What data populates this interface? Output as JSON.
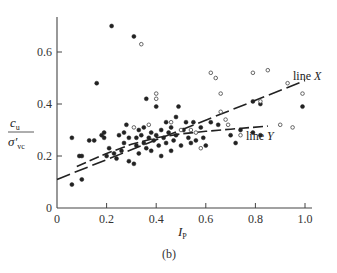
{
  "chart_data": {
    "type": "scatter",
    "title": "",
    "caption": "(b)",
    "xlabel": "I_P",
    "ylabel": "c_u / σ'_vc",
    "xlim": [
      0,
      1.0
    ],
    "ylim": [
      0,
      0.72
    ],
    "xticks": [
      "0",
      "0.2",
      "0.4",
      "0.6",
      "0.8",
      "1.0"
    ],
    "yticks": [
      "0",
      "0.2",
      "0.4",
      "0.6"
    ],
    "grid": false,
    "series": [
      {
        "name": "filled points",
        "marker": "filled-circle",
        "points": [
          [
            0.06,
            0.09
          ],
          [
            0.06,
            0.27
          ],
          [
            0.1,
            0.11
          ],
          [
            0.09,
            0.2
          ],
          [
            0.1,
            0.2
          ],
          [
            0.13,
            0.26
          ],
          [
            0.15,
            0.26
          ],
          [
            0.16,
            0.48
          ],
          [
            0.18,
            0.28
          ],
          [
            0.19,
            0.29
          ],
          [
            0.19,
            0.27
          ],
          [
            0.2,
            0.2
          ],
          [
            0.21,
            0.23
          ],
          [
            0.22,
            0.7
          ],
          [
            0.23,
            0.21
          ],
          [
            0.24,
            0.19
          ],
          [
            0.25,
            0.28
          ],
          [
            0.26,
            0.22
          ],
          [
            0.27,
            0.25
          ],
          [
            0.27,
            0.29
          ],
          [
            0.28,
            0.32
          ],
          [
            0.29,
            0.27
          ],
          [
            0.29,
            0.18
          ],
          [
            0.31,
            0.17
          ],
          [
            0.31,
            0.66
          ],
          [
            0.32,
            0.24
          ],
          [
            0.32,
            0.27
          ],
          [
            0.33,
            0.3
          ],
          [
            0.33,
            0.21
          ],
          [
            0.34,
            0.28
          ],
          [
            0.35,
            0.25
          ],
          [
            0.35,
            0.31
          ],
          [
            0.36,
            0.42
          ],
          [
            0.36,
            0.23
          ],
          [
            0.37,
            0.27
          ],
          [
            0.38,
            0.29
          ],
          [
            0.38,
            0.22
          ],
          [
            0.39,
            0.26
          ],
          [
            0.4,
            0.39
          ],
          [
            0.4,
            0.28
          ],
          [
            0.41,
            0.24
          ],
          [
            0.42,
            0.3
          ],
          [
            0.42,
            0.2
          ],
          [
            0.43,
            0.27
          ],
          [
            0.44,
            0.33
          ],
          [
            0.44,
            0.25
          ],
          [
            0.45,
            0.29
          ],
          [
            0.46,
            0.31
          ],
          [
            0.46,
            0.22
          ],
          [
            0.47,
            0.26
          ],
          [
            0.48,
            0.35
          ],
          [
            0.48,
            0.28
          ],
          [
            0.49,
            0.39
          ],
          [
            0.5,
            0.24
          ],
          [
            0.51,
            0.3
          ],
          [
            0.52,
            0.33
          ],
          [
            0.53,
            0.27
          ],
          [
            0.54,
            0.25
          ],
          [
            0.55,
            0.33
          ],
          [
            0.56,
            0.26
          ],
          [
            0.58,
            0.31
          ],
          [
            0.59,
            0.27
          ],
          [
            0.6,
            0.24
          ],
          [
            0.62,
            0.33
          ],
          [
            0.65,
            0.32
          ],
          [
            0.7,
            0.28
          ],
          [
            0.72,
            0.25
          ],
          [
            0.74,
            0.3
          ],
          [
            0.79,
            0.41
          ],
          [
            0.79,
            0.29
          ],
          [
            0.82,
            0.4
          ],
          [
            0.82,
            0.28
          ],
          [
            0.99,
            0.39
          ]
        ]
      },
      {
        "name": "open points",
        "marker": "open-circle",
        "points": [
          [
            0.34,
            0.63
          ],
          [
            0.4,
            0.44
          ],
          [
            0.4,
            0.42
          ],
          [
            0.37,
            0.32
          ],
          [
            0.31,
            0.31
          ],
          [
            0.46,
            0.33
          ],
          [
            0.5,
            0.3
          ],
          [
            0.54,
            0.3
          ],
          [
            0.56,
            0.29
          ],
          [
            0.58,
            0.23
          ],
          [
            0.62,
            0.52
          ],
          [
            0.64,
            0.5
          ],
          [
            0.66,
            0.44
          ],
          [
            0.66,
            0.37
          ],
          [
            0.68,
            0.34
          ],
          [
            0.69,
            0.32
          ],
          [
            0.74,
            0.28
          ],
          [
            0.79,
            0.52
          ],
          [
            0.82,
            0.41
          ],
          [
            0.85,
            0.53
          ],
          [
            0.9,
            0.32
          ],
          [
            0.93,
            0.48
          ],
          [
            0.95,
            0.31
          ],
          [
            0.99,
            0.44
          ]
        ]
      }
    ],
    "lines": [
      {
        "name": "line X",
        "style": "dashed",
        "label": "line X",
        "x": [
          0.0,
          1.0
        ],
        "y": [
          0.11,
          0.49
        ]
      },
      {
        "name": "line Y",
        "style": "dashed",
        "label": "line Y",
        "x": [
          0.08,
          0.2,
          0.3,
          0.4,
          0.5,
          0.6,
          0.7,
          0.85
        ],
        "y": [
          0.16,
          0.21,
          0.245,
          0.27,
          0.285,
          0.295,
          0.303,
          0.315
        ]
      }
    ]
  },
  "labels": {
    "xlabel_main": "I",
    "xlabel_sub": "P",
    "ylabel_num_main": "c",
    "ylabel_num_sub": "u",
    "ylabel_den_main": "σ′",
    "ylabel_den_sub": "vc",
    "line_x_label": "line X",
    "line_y_label": "line Y",
    "caption": "(b)"
  }
}
